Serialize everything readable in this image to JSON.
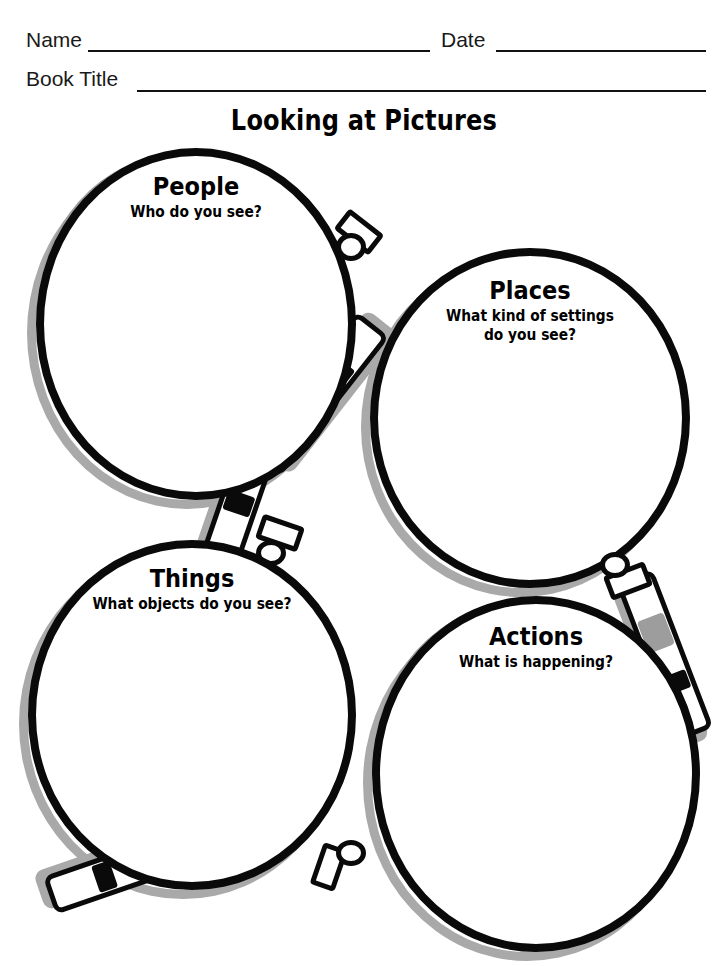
{
  "header": {
    "name_label": "Name",
    "date_label": "Date",
    "book_title_label": "Book Title"
  },
  "worksheet": {
    "title": "Looking at Pictures"
  },
  "magnifiers": [
    {
      "id": "people",
      "title": "People",
      "subtitle_line1": "Who do you see?",
      "subtitle_line2": ""
    },
    {
      "id": "places",
      "title": "Places",
      "subtitle_line1": "What kind of settings",
      "subtitle_line2": "do you see?"
    },
    {
      "id": "things",
      "title": "Things",
      "subtitle_line1": "What objects do you see?",
      "subtitle_line2": ""
    },
    {
      "id": "actions",
      "title": "Actions",
      "subtitle_line1": "What is happening?",
      "subtitle_line2": ""
    }
  ],
  "colors": {
    "ink": "#0a0a0a",
    "shadow_gray": "#a9a9a9",
    "highlight_gray": "#9d9d9d",
    "paper": "#ffffff"
  }
}
